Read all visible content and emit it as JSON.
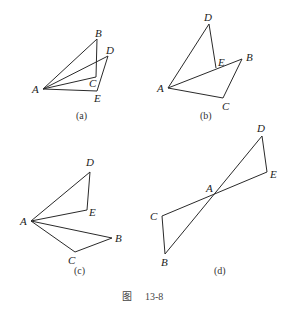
{
  "figure": {
    "title_char": "图",
    "number": "13-8"
  },
  "panels": [
    {
      "caption": "(a)",
      "points": {
        "A": [
          43,
          89
        ],
        "B": [
          97,
          39
        ],
        "C": [
          96,
          77
        ],
        "D": [
          108,
          56
        ],
        "E": [
          97,
          91
        ]
      },
      "labels": {
        "A": "A",
        "B": "B",
        "C": "C",
        "D": "D",
        "E": "E"
      },
      "edges": [
        [
          "A",
          "B"
        ],
        [
          "B",
          "C"
        ],
        [
          "A",
          "C"
        ],
        [
          "A",
          "D"
        ],
        [
          "D",
          "E"
        ],
        [
          "A",
          "E"
        ]
      ]
    },
    {
      "caption": "(b)",
      "points": {
        "A": [
          168,
          88
        ],
        "B": [
          242,
          59
        ],
        "C": [
          223,
          98
        ],
        "D": [
          209,
          24
        ],
        "E": [
          216,
          68
        ]
      },
      "labels": {
        "A": "A",
        "B": "B",
        "C": "C",
        "D": "D",
        "E": "E"
      },
      "edges": [
        [
          "A",
          "D"
        ],
        [
          "D",
          "E"
        ],
        [
          "A",
          "B"
        ],
        [
          "B",
          "C"
        ],
        [
          "A",
          "C"
        ]
      ]
    },
    {
      "caption": "(c)",
      "points": {
        "A": [
          31,
          221
        ],
        "B": [
          112,
          238
        ],
        "C": [
          75,
          252
        ],
        "D": [
          90,
          172
        ],
        "E": [
          87,
          210
        ]
      },
      "labels": {
        "A": "A",
        "B": "B",
        "C": "C",
        "D": "D",
        "E": "E"
      },
      "edges": [
        [
          "A",
          "D"
        ],
        [
          "D",
          "E"
        ],
        [
          "A",
          "E"
        ],
        [
          "A",
          "B"
        ],
        [
          "B",
          "C"
        ],
        [
          "A",
          "C"
        ]
      ]
    },
    {
      "caption": "(d)",
      "points": {
        "A": [
          214,
          194
        ],
        "B": [
          165,
          254
        ],
        "C": [
          162,
          216
        ],
        "D": [
          262,
          136
        ],
        "E": [
          267,
          172
        ]
      },
      "labels": {
        "A": "A",
        "B": "B",
        "C": "C",
        "D": "D",
        "E": "E"
      },
      "edges": [
        [
          "B",
          "D"
        ],
        [
          "D",
          "E"
        ],
        [
          "C",
          "E"
        ],
        [
          "C",
          "B"
        ]
      ]
    }
  ]
}
